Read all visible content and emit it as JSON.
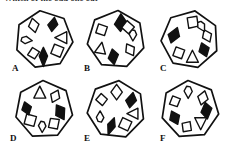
{
  "page": {
    "prompt_text_partial": "Which of the odd one out",
    "background_color": "#ffffff",
    "stroke_color": "#111111",
    "fill_black": "#111111",
    "fill_white": "#ffffff"
  },
  "options": [
    {
      "id": "A",
      "label": "A",
      "label_x": 8,
      "label_y": 58,
      "polygon_sides": 7,
      "rotation_deg": -8,
      "inner_shapes": [
        {
          "name": "black-kite",
          "angle_deg": -62,
          "fill": "black",
          "kind": "kite",
          "size": 13,
          "spin": 18
        },
        {
          "name": "white-diamond",
          "angle_deg": -126,
          "fill": "white",
          "kind": "diamond",
          "size": 14,
          "spin": -12
        },
        {
          "name": "white-teardrop",
          "angle_deg": 178,
          "fill": "white",
          "kind": "teardrop",
          "size": 11,
          "spin": 96
        },
        {
          "name": "white-tag",
          "angle_deg": 128,
          "fill": "white",
          "kind": "tag",
          "size": 11,
          "spin": 42
        },
        {
          "name": "black-leaf",
          "angle_deg": 92,
          "fill": "black",
          "kind": "leaf",
          "size": 16,
          "spin": 0
        },
        {
          "name": "white-square",
          "angle_deg": 40,
          "fill": "white",
          "kind": "square",
          "size": 12,
          "spin": 22
        },
        {
          "name": "white-triangle",
          "angle_deg": -6,
          "fill": "white",
          "kind": "triangle",
          "size": 13,
          "spin": -90
        }
      ]
    },
    {
      "id": "B",
      "label": "B",
      "label_x": 8,
      "label_y": 58,
      "polygon_sides": 7,
      "rotation_deg": 4,
      "inner_shapes": [
        {
          "name": "black-kite",
          "angle_deg": -78,
          "fill": "black",
          "kind": "kite",
          "size": 16,
          "spin": 8
        },
        {
          "name": "white-square",
          "angle_deg": -146,
          "fill": "white",
          "kind": "square",
          "size": 11,
          "spin": 18
        },
        {
          "name": "white-triangle",
          "angle_deg": 150,
          "fill": "white",
          "kind": "triangle",
          "size": 12,
          "spin": 10
        },
        {
          "name": "black-kite-2",
          "angle_deg": 96,
          "fill": "black",
          "kind": "kite",
          "size": 14,
          "spin": 180
        },
        {
          "name": "white-diamond",
          "angle_deg": 36,
          "fill": "white",
          "kind": "diamond",
          "size": 13,
          "spin": -30
        },
        {
          "name": "white-teardrop",
          "angle_deg": -14,
          "fill": "white",
          "kind": "teardrop",
          "size": 11,
          "spin": 180
        },
        {
          "name": "white-tag",
          "angle_deg": -46,
          "fill": "white",
          "kind": "tag",
          "size": 12,
          "spin": 140
        }
      ]
    },
    {
      "id": "C",
      "label": "C",
      "label_x": 10,
      "label_y": 58,
      "polygon_sides": 7,
      "rotation_deg": 10,
      "inner_shapes": [
        {
          "name": "white-tag",
          "angle_deg": -82,
          "fill": "white",
          "kind": "tag",
          "size": 13,
          "spin": 0
        },
        {
          "name": "black-kite",
          "angle_deg": -164,
          "fill": "black",
          "kind": "kite",
          "size": 15,
          "spin": 30
        },
        {
          "name": "white-square",
          "angle_deg": 130,
          "fill": "white",
          "kind": "square",
          "size": 11,
          "spin": 20
        },
        {
          "name": "white-triangle",
          "angle_deg": 82,
          "fill": "white",
          "kind": "triangle",
          "size": 13,
          "spin": 0
        },
        {
          "name": "black-diamond",
          "angle_deg": 36,
          "fill": "black",
          "kind": "diamond",
          "size": 14,
          "spin": -20
        },
        {
          "name": "white-diamond",
          "angle_deg": -12,
          "fill": "white",
          "kind": "diamond",
          "size": 13,
          "spin": -25
        },
        {
          "name": "white-teardrop",
          "angle_deg": -48,
          "fill": "white",
          "kind": "teardrop",
          "size": 11,
          "spin": 150
        }
      ]
    },
    {
      "id": "D",
      "label": "D",
      "label_x": 6,
      "label_y": 58,
      "polygon_sides": 7,
      "rotation_deg": -2,
      "inner_shapes": [
        {
          "name": "white-triangle",
          "angle_deg": -104,
          "fill": "white",
          "kind": "triangle",
          "size": 13,
          "spin": 0
        },
        {
          "name": "white-diamond",
          "angle_deg": -50,
          "fill": "white",
          "kind": "diamond",
          "size": 13,
          "spin": 25
        },
        {
          "name": "black-kite",
          "angle_deg": 8,
          "fill": "black",
          "kind": "kite",
          "size": 15,
          "spin": 160
        },
        {
          "name": "white-tag",
          "angle_deg": 54,
          "fill": "white",
          "kind": "tag",
          "size": 12,
          "spin": 200
        },
        {
          "name": "white-teardrop",
          "angle_deg": 96,
          "fill": "white",
          "kind": "teardrop",
          "size": 11,
          "spin": 180
        },
        {
          "name": "white-square",
          "angle_deg": 142,
          "fill": "white",
          "kind": "square",
          "size": 12,
          "spin": 15
        },
        {
          "name": "black-diamond",
          "angle_deg": 184,
          "fill": "black",
          "kind": "diamond",
          "size": 13,
          "spin": -18
        }
      ]
    },
    {
      "id": "E",
      "label": "E",
      "label_x": 8,
      "label_y": 58,
      "polygon_sides": 7,
      "rotation_deg": 6,
      "inner_shapes": [
        {
          "name": "white-diamond",
          "angle_deg": -88,
          "fill": "white",
          "kind": "diamond",
          "size": 15,
          "spin": 0
        },
        {
          "name": "black-kite",
          "angle_deg": -34,
          "fill": "black",
          "kind": "kite",
          "size": 14,
          "spin": 20
        },
        {
          "name": "white-triangle",
          "angle_deg": 14,
          "fill": "white",
          "kind": "triangle",
          "size": 12,
          "spin": -90
        },
        {
          "name": "white-square",
          "angle_deg": 58,
          "fill": "white",
          "kind": "square",
          "size": 12,
          "spin": 25
        },
        {
          "name": "black-leaf",
          "angle_deg": 106,
          "fill": "black",
          "kind": "leaf",
          "size": 15,
          "spin": 20
        },
        {
          "name": "white-teardrop",
          "angle_deg": 156,
          "fill": "white",
          "kind": "teardrop",
          "size": 11,
          "spin": 0
        },
        {
          "name": "white-tag",
          "angle_deg": -146,
          "fill": "white",
          "kind": "tag",
          "size": 11,
          "spin": -40
        }
      ]
    },
    {
      "id": "F",
      "label": "F",
      "label_x": 10,
      "label_y": 58,
      "polygon_sides": 7,
      "rotation_deg": -4,
      "inner_shapes": [
        {
          "name": "white-teardrop",
          "angle_deg": -96,
          "fill": "white",
          "kind": "teardrop",
          "size": 12,
          "spin": 180
        },
        {
          "name": "white-diamond",
          "angle_deg": -42,
          "fill": "white",
          "kind": "diamond",
          "size": 14,
          "spin": 15
        },
        {
          "name": "black-kite",
          "angle_deg": 4,
          "fill": "black",
          "kind": "kite",
          "size": 15,
          "spin": 180
        },
        {
          "name": "white-triangle",
          "angle_deg": 52,
          "fill": "white",
          "kind": "triangle",
          "size": 13,
          "spin": 180
        },
        {
          "name": "white-tag",
          "angle_deg": 100,
          "fill": "white",
          "kind": "tag",
          "size": 11,
          "spin": 180
        },
        {
          "name": "black-parallelogram",
          "angle_deg": 152,
          "fill": "black",
          "kind": "diamond",
          "size": 14,
          "spin": -25
        },
        {
          "name": "white-flag",
          "angle_deg": -152,
          "fill": "white",
          "kind": "tag",
          "size": 11,
          "spin": 30
        }
      ]
    }
  ],
  "layout": {
    "cols": 3,
    "rows": 2,
    "cell_width": 76,
    "cell_height": 73,
    "cell_origins": [
      {
        "id": "A",
        "x": 4,
        "y": 0
      },
      {
        "id": "B",
        "x": 76,
        "y": 0
      },
      {
        "id": "C",
        "x": 150,
        "y": 0
      },
      {
        "id": "D",
        "x": 4,
        "y": 70
      },
      {
        "id": "E",
        "x": 76,
        "y": 70
      },
      {
        "id": "F",
        "x": 150,
        "y": 70
      }
    ]
  }
}
